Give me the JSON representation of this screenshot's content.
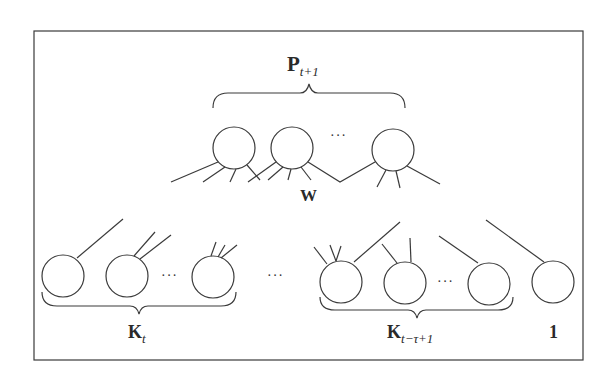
{
  "diagram": {
    "type": "neural-network-layer-diagram",
    "colors": {
      "stroke": "#3a3a3a",
      "background": "#ffffff",
      "text": "#2a2a2a"
    },
    "labels": {
      "top_group": {
        "main": "P",
        "sub": "t+1"
      },
      "weights": "W",
      "left_group": {
        "main": "K",
        "sub": "t"
      },
      "right_group": {
        "main": "K",
        "sub": "t−τ+1"
      },
      "bias": "1"
    },
    "ellipsis": "···",
    "nodes": {
      "top": [
        {
          "cx": 234,
          "cy": 148
        },
        {
          "cx": 292,
          "cy": 148
        },
        {
          "cx": 393,
          "cy": 150
        }
      ],
      "bottom_left": [
        {
          "cx": 63,
          "cy": 276
        },
        {
          "cx": 127,
          "cy": 276
        },
        {
          "cx": 213,
          "cy": 277
        }
      ],
      "bottom_right": [
        {
          "cx": 341,
          "cy": 282
        },
        {
          "cx": 405,
          "cy": 283
        },
        {
          "cx": 489,
          "cy": 284
        }
      ],
      "bias_node": {
        "cx": 553,
        "cy": 282
      }
    }
  }
}
